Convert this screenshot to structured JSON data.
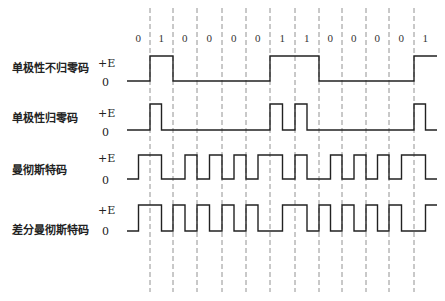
{
  "diagram": {
    "bits": [
      "0",
      "1",
      "0",
      "0",
      "0",
      "0",
      "1",
      "1",
      "0",
      "0",
      "0",
      "0",
      "1"
    ],
    "level_high_label": "+E",
    "level_zero_label": "0",
    "rows": [
      {
        "id": "nrz",
        "label": "单极性不归零码"
      },
      {
        "id": "rz",
        "label": "单极性归零码"
      },
      {
        "id": "manchester",
        "label": "曼彻斯特码"
      },
      {
        "id": "diff_manchester",
        "label": "差分曼彻斯特码"
      }
    ],
    "boundaries_x": [
      150,
      173,
      197,
      222,
      246,
      270,
      295,
      319,
      342,
      366,
      389,
      414
    ],
    "start_x": 127,
    "end_x": 437
  }
}
